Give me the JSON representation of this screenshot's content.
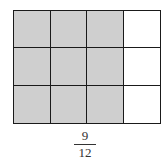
{
  "diagram": {
    "type": "fraction-grid",
    "rows": 3,
    "columns": 4,
    "shaded_cells": 9,
    "total_cells": 12,
    "shaded_color": "#cfcfcf",
    "unshaded_color": "#ffffff",
    "line_color": "#1a1a1a",
    "cells": [
      [
        true,
        true,
        true,
        false
      ],
      [
        true,
        true,
        true,
        false
      ],
      [
        true,
        true,
        true,
        false
      ]
    ]
  },
  "fraction": {
    "numerator": "9",
    "denominator": "12"
  }
}
